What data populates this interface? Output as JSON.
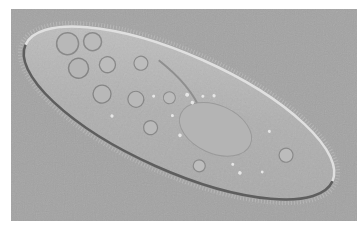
{
  "image": {
    "subject": "paramecium",
    "description": "Differential interference contrast micrograph of a paramecium on a gray background",
    "colors": {
      "page_background": "#ffffff",
      "image_background": "#a3a3a3",
      "cell_body": "#b2b2b2",
      "cell_edge_light": "#e2e2e2",
      "cell_edge_dark": "#5a5a5a"
    }
  }
}
